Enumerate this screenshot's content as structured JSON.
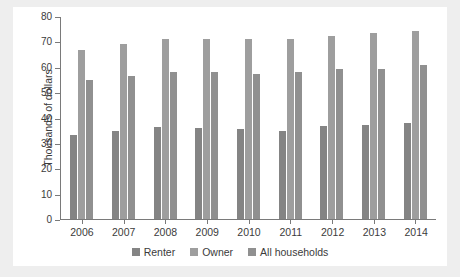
{
  "chart_data": {
    "type": "bar",
    "title": "",
    "subtitle": "",
    "xlabel": "",
    "ylabel": "Thousands of dollars",
    "categories": [
      "2006",
      "2007",
      "2008",
      "2009",
      "2010",
      "2011",
      "2012",
      "2013",
      "2014"
    ],
    "series": [
      {
        "name": "Renter",
        "color": "#848484",
        "values": [
          33.3,
          34.8,
          36.1,
          35.7,
          35.3,
          34.8,
          36.6,
          36.9,
          37.8
        ]
      },
      {
        "name": "Owner",
        "color": "#9e9e9e",
        "values": [
          66.7,
          69.0,
          71.0,
          71.0,
          71.0,
          71.0,
          72.2,
          73.4,
          74.0
        ]
      },
      {
        "name": "All households",
        "color": "#909090",
        "values": [
          54.9,
          56.5,
          58.1,
          58.1,
          57.3,
          57.8,
          59.0,
          59.2,
          60.7
        ]
      }
    ],
    "ylim": [
      0,
      80
    ],
    "ytick_values": [
      0,
      10,
      20,
      30,
      40,
      50,
      60,
      70,
      80
    ],
    "ytick_labels": [
      "0",
      "10",
      "20",
      "30",
      "40",
      "50",
      "60",
      "70",
      "80"
    ],
    "grid": false,
    "legend_position": "bottom"
  },
  "colors": {
    "figure_background": "#ffffff",
    "page_background": "#eeeeee",
    "axis": "#7a7a7a",
    "text": "#3b3b3b"
  }
}
